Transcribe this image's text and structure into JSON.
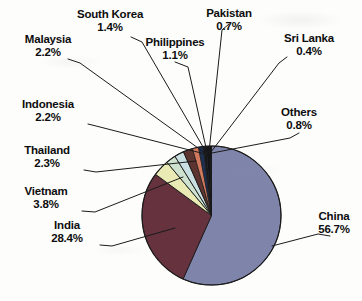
{
  "chart_data": {
    "type": "pie",
    "title": "",
    "subtitle": "",
    "xlabel": "",
    "ylabel": "",
    "legend_position": "none",
    "labels_position": "outside-with-leader-lines",
    "grid": false,
    "start_angle_deg": 0,
    "direction": "clockwise",
    "units": "percent",
    "categories": [
      "China",
      "India",
      "Vietnam",
      "Thailand",
      "Indonesia",
      "Malaysia",
      "South Korea",
      "Philippines",
      "Pakistan",
      "Others",
      "Sri Lanka"
    ],
    "values": [
      56.7,
      28.4,
      3.8,
      2.3,
      2.2,
      2.2,
      1.4,
      1.1,
      0.7,
      0.8,
      0.4
    ],
    "colors": [
      "#7f84ab",
      "#65323e",
      "#e9eab4",
      "#cfe2cf",
      "#c9dfe2",
      "#5d3430",
      "#d2785c",
      "#1d2f52",
      "#17181c",
      "#121317",
      "#0f1014"
    ],
    "slices": [
      {
        "name": "China",
        "percent": "56.7%",
        "value": 56.7,
        "color": "#7f84ab"
      },
      {
        "name": "India",
        "percent": "28.4%",
        "value": 28.4,
        "color": "#65323e"
      },
      {
        "name": "Vietnam",
        "percent": "3.8%",
        "value": 3.8,
        "color": "#e9eab4"
      },
      {
        "name": "Thailand",
        "percent": "2.3%",
        "value": 2.3,
        "color": "#cfe2cf"
      },
      {
        "name": "Indonesia",
        "percent": "2.2%",
        "value": 2.2,
        "color": "#c9dfe2"
      },
      {
        "name": "Malaysia",
        "percent": "2.2%",
        "value": 2.2,
        "color": "#5d3430"
      },
      {
        "name": "South Korea",
        "percent": "1.4%",
        "value": 1.4,
        "color": "#d2785c"
      },
      {
        "name": "Philippines",
        "percent": "1.1%",
        "value": 1.1,
        "color": "#1d2f52"
      },
      {
        "name": "Pakistan",
        "percent": "0.7%",
        "value": 0.7,
        "color": "#17181c"
      },
      {
        "name": "Others",
        "percent": "0.8%",
        "value": 0.8,
        "color": "#121317"
      },
      {
        "name": "Sri Lanka",
        "percent": "0.4%",
        "value": 0.4,
        "color": "#0f1014"
      }
    ]
  },
  "labels": {
    "south_korea": {
      "name": "South Korea",
      "percent": "1.4%"
    },
    "pakistan": {
      "name": "Pakistan",
      "percent": "0.7%"
    },
    "philippines": {
      "name": "Philippines",
      "percent": "1.1%"
    },
    "sri_lanka": {
      "name": "Sri Lanka",
      "percent": "0.4%"
    },
    "malaysia": {
      "name": "Malaysia",
      "percent": "2.2%"
    },
    "others": {
      "name": "Others",
      "percent": "0.8%"
    },
    "indonesia": {
      "name": "Indonesia",
      "percent": "2.2%"
    },
    "thailand": {
      "name": "Thailand",
      "percent": "2.3%"
    },
    "vietnam": {
      "name": "Vietnam",
      "percent": "3.8%"
    },
    "india": {
      "name": "India",
      "percent": "28.4%"
    },
    "china": {
      "name": "China",
      "percent": "56.7%"
    }
  }
}
